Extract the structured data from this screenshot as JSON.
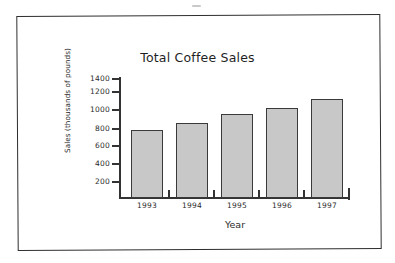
{
  "chart_data": {
    "type": "bar",
    "title": "Total Coffee Sales",
    "xlabel": "Year",
    "ylabel": "Sales (thousands of pounds)",
    "categories": [
      "1993",
      "1994",
      "1995",
      "1996",
      "1997"
    ],
    "values": [
      795,
      880,
      980,
      1050,
      1160
    ],
    "ylim": [
      0,
      1400
    ],
    "ytick_labels": [
      "1400",
      "1200",
      "1000",
      "800",
      "600",
      "400",
      "200"
    ],
    "ytick_values": [
      1400,
      1200,
      1000,
      800,
      600,
      400,
      200
    ],
    "grid": false,
    "legend": false,
    "bar_fill_color": "#c8c8c8",
    "bar_edge_color": "#3a3a3a",
    "axis_color": "#333333",
    "background_color": "#ffffff",
    "frame_color": "#2e2e2e"
  }
}
